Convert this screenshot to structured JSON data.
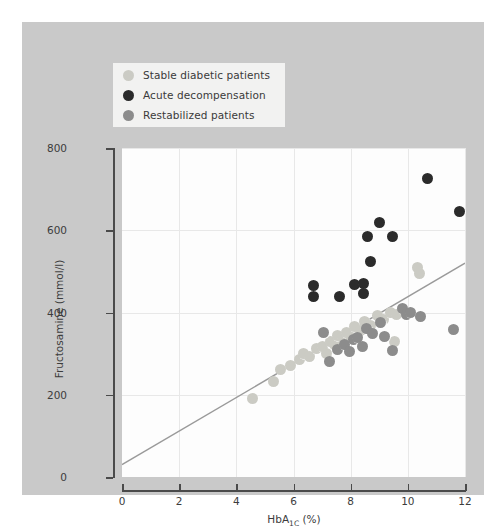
{
  "figure": {
    "background": "#c9c9c9",
    "plot_background": "#fdfdfd"
  },
  "legend": {
    "position": "top-left-inside",
    "entries": [
      {
        "label": "Stable diabetic patients",
        "color": "#cbcbc4"
      },
      {
        "label": "Acute decompensation",
        "color": "#2b2b2b"
      },
      {
        "label": "Restabilized patients",
        "color": "#8c8c8c"
      }
    ]
  },
  "chart_data": {
    "type": "scatter",
    "title": "",
    "xlabel": "HbA1C (%)",
    "xlabel_base": "HbA",
    "xlabel_sub": "1C",
    "xlabel_unit": "(%)",
    "ylabel": "Fructosamine (mmol/l)",
    "xlim": [
      0,
      12
    ],
    "ylim": [
      0,
      800
    ],
    "xticks": [
      0,
      2,
      4,
      6,
      8,
      10,
      12
    ],
    "yticks": [
      0,
      200,
      400,
      600,
      800
    ],
    "grid": true,
    "trendline": {
      "color": "#9a9a9a",
      "x_start": 0.0,
      "y_start": 30,
      "x_end": 12.0,
      "y_end": 520
    },
    "series": [
      {
        "name": "Stable diabetic patients",
        "color": "#cbcbc4",
        "points": [
          [
            4.55,
            192
          ],
          [
            5.3,
            233
          ],
          [
            5.55,
            262
          ],
          [
            5.9,
            272
          ],
          [
            6.2,
            285
          ],
          [
            6.35,
            300
          ],
          [
            6.55,
            292
          ],
          [
            6.8,
            312
          ],
          [
            7.0,
            318
          ],
          [
            7.15,
            300
          ],
          [
            7.3,
            330
          ],
          [
            7.45,
            322
          ],
          [
            7.55,
            345
          ],
          [
            7.7,
            338
          ],
          [
            7.85,
            352
          ],
          [
            8.0,
            344
          ],
          [
            8.15,
            366
          ],
          [
            8.35,
            356
          ],
          [
            8.5,
            378
          ],
          [
            8.7,
            368
          ],
          [
            8.95,
            392
          ],
          [
            9.15,
            382
          ],
          [
            9.4,
            400
          ],
          [
            9.6,
            396
          ],
          [
            10.35,
            510
          ],
          [
            10.4,
            495
          ],
          [
            9.55,
            330
          ]
        ]
      },
      {
        "name": "Acute decompensation",
        "color": "#2b2b2b",
        "points": [
          [
            6.7,
            465
          ],
          [
            6.7,
            440
          ],
          [
            7.6,
            440
          ],
          [
            8.15,
            468
          ],
          [
            8.45,
            470
          ],
          [
            8.45,
            445
          ],
          [
            8.6,
            585
          ],
          [
            8.7,
            525
          ],
          [
            9.0,
            620
          ],
          [
            9.45,
            585
          ],
          [
            10.7,
            725
          ],
          [
            11.8,
            645
          ]
        ]
      },
      {
        "name": "Restabilized patients",
        "color": "#8c8c8c",
        "points": [
          [
            7.25,
            282
          ],
          [
            7.55,
            310
          ],
          [
            7.8,
            322
          ],
          [
            7.95,
            306
          ],
          [
            8.1,
            334
          ],
          [
            8.25,
            340
          ],
          [
            8.4,
            318
          ],
          [
            8.55,
            362
          ],
          [
            8.75,
            348
          ],
          [
            9.05,
            375
          ],
          [
            9.2,
            342
          ],
          [
            9.45,
            308
          ],
          [
            9.8,
            410
          ],
          [
            9.95,
            395
          ],
          [
            10.1,
            400
          ],
          [
            10.45,
            390
          ],
          [
            11.6,
            358
          ],
          [
            7.05,
            352
          ]
        ]
      }
    ]
  }
}
